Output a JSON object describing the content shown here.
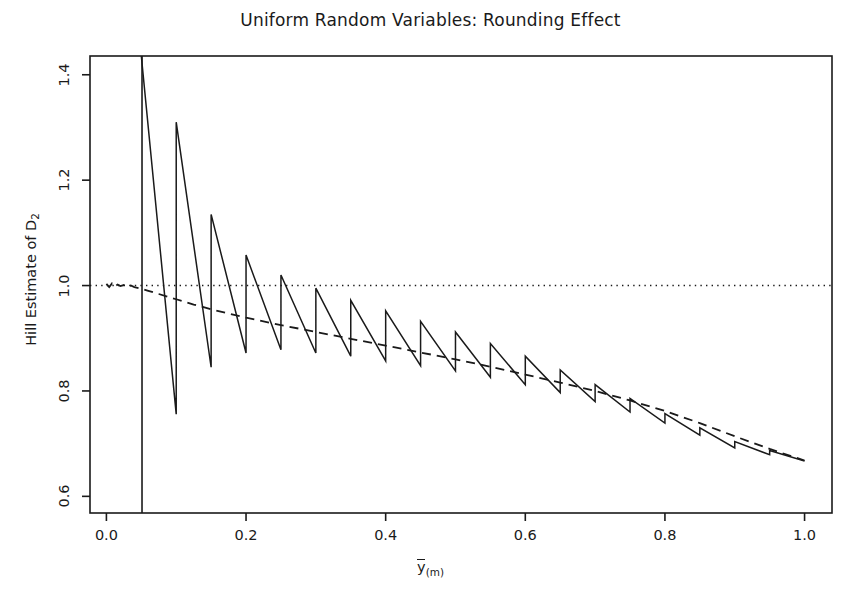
{
  "chart_data": {
    "type": "line",
    "title": "Uniform Random Variables: Rounding Effect",
    "xlabel": "y(m)",
    "xlabel_parts": {
      "base": "y",
      "overbar": true,
      "subscript": "(m)"
    },
    "ylabel": "Hill Estimate of D2",
    "ylabel_parts": {
      "text": "Hill Estimate of D",
      "subscript": "2"
    },
    "xlim": [
      -0.0235,
      1.0393
    ],
    "ylim": [
      0.5684,
      1.4356
    ],
    "xticks": [
      0.0,
      0.2,
      0.4,
      0.6,
      0.8,
      1.0
    ],
    "xtick_labels": [
      "0.0",
      "0.2",
      "0.4",
      "0.6",
      "0.8",
      "1.0"
    ],
    "yticks": [
      0.6,
      0.8,
      1.0,
      1.2,
      1.4
    ],
    "ytick_labels": [
      "0.6",
      "0.8",
      "1.0",
      "1.2",
      "1.4"
    ],
    "grid": false,
    "legend": null,
    "box": true,
    "series": [
      {
        "name": "reference-line-at-one",
        "style": "dotted",
        "color": "#1a1a1a",
        "orientation": "horizontal",
        "y": 1.0,
        "x_from": -0.0235,
        "x_to": 1.0393
      },
      {
        "name": "vertical-cutoff-line",
        "style": "solid",
        "color": "#1a1a1a",
        "orientation": "vertical",
        "x": 0.051,
        "y_from": 0.5684,
        "y_to": 1.4356
      },
      {
        "name": "smooth-hill-estimate",
        "style": "dashed",
        "color": "#1a1a1a",
        "comment": "smooth theoretical/unrounded Hill estimate, decays from 1.0 toward 0.667",
        "x": [
          0.0,
          0.004,
          0.008,
          0.012,
          0.016,
          0.02,
          0.025,
          0.03,
          0.035,
          0.04,
          0.05,
          0.06,
          0.075,
          0.1,
          0.125,
          0.15,
          0.175,
          0.2,
          0.25,
          0.3,
          0.35,
          0.4,
          0.45,
          0.5,
          0.55,
          0.6,
          0.65,
          0.7,
          0.75,
          0.8,
          0.85,
          0.9,
          0.95,
          1.0
        ],
        "y": [
          1.003,
          0.997,
          1.004,
          0.998,
          1.002,
          0.999,
          1.001,
          0.998,
          1.0,
          0.997,
          0.994,
          0.99,
          0.984,
          0.974,
          0.964,
          0.955,
          0.947,
          0.939,
          0.925,
          0.912,
          0.899,
          0.886,
          0.873,
          0.86,
          0.846,
          0.831,
          0.816,
          0.8,
          0.782,
          0.762,
          0.739,
          0.714,
          0.69,
          0.668
        ]
      },
      {
        "name": "rounded-hill-estimate-sawtooth",
        "style": "solid",
        "color": "#1a1a1a",
        "comment": "Hill estimate computed from rounded data; sawtooth with period 0.05 in x, amplitude decaying with x",
        "period": 0.05,
        "teeth": [
          {
            "peak_x": 0.05,
            "peak_y": 1.4356,
            "trough_x": 0.1,
            "trough_y": 0.756
          },
          {
            "peak_x": 0.1,
            "peak_y": 1.31,
            "trough_x": 0.15,
            "trough_y": 0.845
          },
          {
            "peak_x": 0.15,
            "peak_y": 1.135,
            "trough_x": 0.2,
            "trough_y": 0.872
          },
          {
            "peak_x": 0.2,
            "peak_y": 1.058,
            "trough_x": 0.25,
            "trough_y": 0.878
          },
          {
            "peak_x": 0.25,
            "peak_y": 1.02,
            "trough_x": 0.3,
            "trough_y": 0.872
          },
          {
            "peak_x": 0.3,
            "peak_y": 0.995,
            "trough_x": 0.35,
            "trough_y": 0.866
          },
          {
            "peak_x": 0.35,
            "peak_y": 0.972,
            "trough_x": 0.4,
            "trough_y": 0.857
          },
          {
            "peak_x": 0.4,
            "peak_y": 0.952,
            "trough_x": 0.45,
            "trough_y": 0.848
          },
          {
            "peak_x": 0.45,
            "peak_y": 0.932,
            "trough_x": 0.5,
            "trough_y": 0.838
          },
          {
            "peak_x": 0.5,
            "peak_y": 0.912,
            "trough_x": 0.55,
            "trough_y": 0.826
          },
          {
            "peak_x": 0.55,
            "peak_y": 0.89,
            "trough_x": 0.6,
            "trough_y": 0.812
          },
          {
            "peak_x": 0.6,
            "peak_y": 0.866,
            "trough_x": 0.65,
            "trough_y": 0.797
          },
          {
            "peak_x": 0.65,
            "peak_y": 0.84,
            "trough_x": 0.7,
            "trough_y": 0.78
          },
          {
            "peak_x": 0.7,
            "peak_y": 0.812,
            "trough_x": 0.75,
            "trough_y": 0.76
          },
          {
            "peak_x": 0.75,
            "peak_y": 0.786,
            "trough_x": 0.8,
            "trough_y": 0.739
          },
          {
            "peak_x": 0.8,
            "peak_y": 0.757,
            "trough_x": 0.85,
            "trough_y": 0.716
          },
          {
            "peak_x": 0.85,
            "peak_y": 0.73,
            "trough_x": 0.9,
            "trough_y": 0.692
          },
          {
            "peak_x": 0.9,
            "peak_y": 0.704,
            "trough_x": 0.95,
            "trough_y": 0.679
          },
          {
            "peak_x": 0.95,
            "peak_y": 0.687,
            "trough_x": 1.0,
            "trough_y": 0.667
          }
        ]
      }
    ]
  }
}
